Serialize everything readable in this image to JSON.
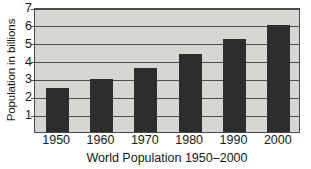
{
  "chart_data": {
    "type": "bar",
    "title": "",
    "subtitle": "",
    "xlabel": "World Population 1950–2000",
    "ylabel": "Population in billions",
    "categories": [
      "1950",
      "1960",
      "1970",
      "1980",
      "1990",
      "2000"
    ],
    "values": [
      2.45,
      2.95,
      3.6,
      4.35,
      5.2,
      6.0
    ],
    "ylim": [
      0,
      7
    ],
    "yticks": [
      1,
      2,
      3,
      4,
      5,
      6,
      7
    ],
    "ytick_labels": [
      "1",
      "2",
      "3",
      "4",
      "5",
      "6",
      "7"
    ],
    "grid": true,
    "grid_axis": "y",
    "legend": false,
    "legend_position": "none",
    "bar_color": "#2d2d2d",
    "plot_background_color": "#d6d6d3",
    "page_background_color": "#ffffff",
    "grid_color": "#4f4f4f",
    "axis_color": "#4a4a4a",
    "text_color": "#171717"
  }
}
